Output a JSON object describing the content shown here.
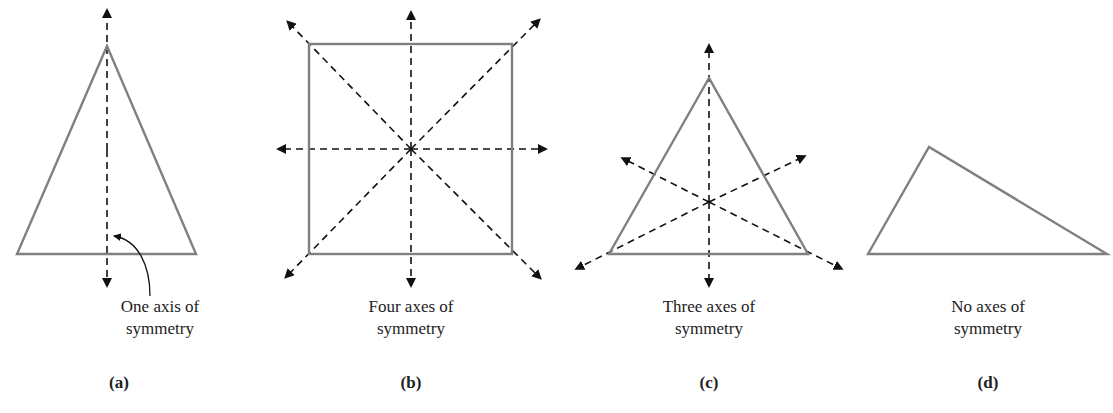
{
  "figures": [
    {
      "id": "a",
      "caption_line1": "One axis of",
      "caption_line2": "symmetry",
      "label": "(a)",
      "shape": "isosceles triangle",
      "axes": 1
    },
    {
      "id": "b",
      "caption_line1": "Four axes of",
      "caption_line2": "symmetry",
      "label": "(b)",
      "shape": "square",
      "axes": 4
    },
    {
      "id": "c",
      "caption_line1": "Three axes of",
      "caption_line2": "symmetry",
      "label": "(c)",
      "shape": "equilateral triangle",
      "axes": 3
    },
    {
      "id": "d",
      "caption_line1": "No axes of",
      "caption_line2": "symmetry",
      "label": "(d)",
      "shape": "scalene triangle",
      "axes": 0
    }
  ],
  "colors": {
    "shape_stroke": "#808080",
    "axis_stroke": "#111111"
  }
}
